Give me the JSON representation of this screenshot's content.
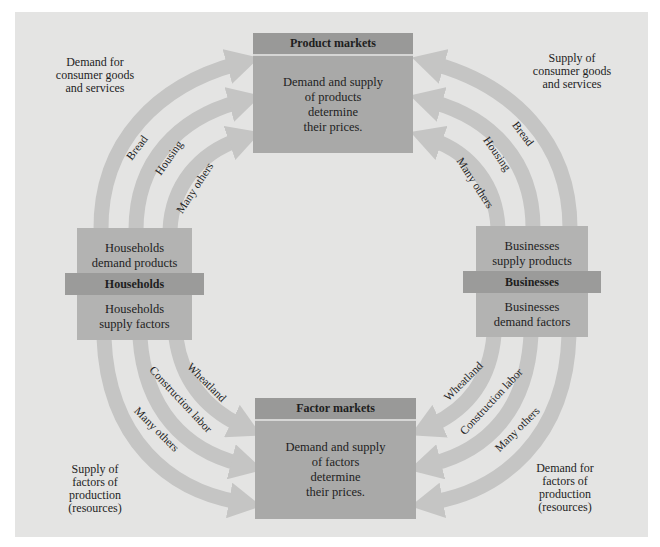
{
  "diagram": {
    "type": "circular-flow",
    "colors": {
      "page_bg": "#ffffff",
      "panel_bg": "#e4e4e3",
      "market_box": "#a9a9a8",
      "market_header": "#999998",
      "agent_box": "#b3b3b2",
      "agent_band": "#9b9b9a",
      "arrow": "#c5c5c4"
    },
    "product_markets": {
      "title": "Product markets",
      "body": "Demand and supply\nof products\ndetermine\ntheir prices."
    },
    "factor_markets": {
      "title": "Factor markets",
      "body": "Demand and supply\nof factors\ndetermine\ntheir prices."
    },
    "households": {
      "title": "Households",
      "top_text": "Households\ndemand products",
      "bottom_text": "Households\nsupply factors"
    },
    "businesses": {
      "title": "Businesses",
      "top_text": "Businesses\nsupply products",
      "bottom_text": "Businesses\ndemand factors"
    },
    "corner_labels": {
      "top_left": "Demand for\nconsumer goods\nand services",
      "top_right": "Supply of\nconsumer goods\nand services",
      "bottom_left": "Supply of\nfactors of\nproduction\n(resources)",
      "bottom_right": "Demand for\nfactors of\nproduction\n(resources)"
    },
    "flows": {
      "households_to_product_markets": [
        "Bread",
        "Housing",
        "Many others"
      ],
      "businesses_to_product_markets": [
        "Bread",
        "Housing",
        "Many others"
      ],
      "households_to_factor_markets": [
        "Wheatland",
        "Construction labor",
        "Many others"
      ],
      "businesses_to_factor_markets": [
        "Wheatland",
        "Construction labor",
        "Many others"
      ]
    }
  }
}
